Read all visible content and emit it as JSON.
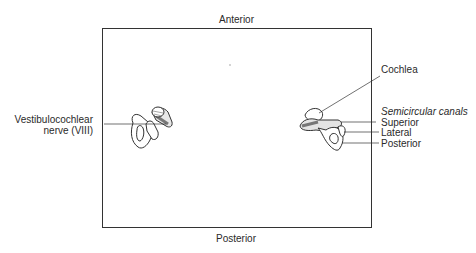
{
  "diagram": {
    "orientation": {
      "top": "Anterior",
      "bottom": "Posterior"
    },
    "left_structure": {
      "label_line1": "Vestibulocochlear",
      "label_line2": "nerve (VIII)"
    },
    "right_structure": {
      "cochlea": "Cochlea",
      "canals_heading": "Semicircular canals",
      "canals": [
        "Superior",
        "Lateral",
        "Posterior"
      ]
    },
    "colors": {
      "line": "#333333",
      "text": "#2a2a2a",
      "shade": "#9a9a9a"
    }
  }
}
